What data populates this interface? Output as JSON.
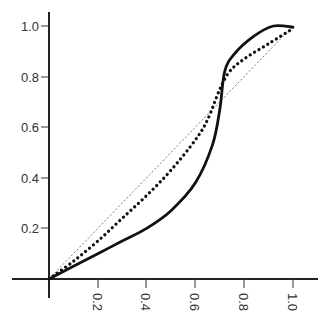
{
  "chart_data": {
    "type": "line",
    "title": "",
    "xlabel": "",
    "ylabel": "",
    "xlim": [
      0,
      1.0
    ],
    "ylim": [
      0,
      1.0
    ],
    "grid": false,
    "legend": null,
    "x_ticks": [
      "0.2",
      "0.4",
      "0.6",
      "0.8",
      "1.0"
    ],
    "y_ticks": [
      "0.2",
      "0.4",
      "0.6",
      "0.8",
      "1.0"
    ],
    "series": [
      {
        "name": "diagonal (thin dashed)",
        "style": "thin-dashed",
        "points": [
          [
            0,
            0
          ],
          [
            1.0,
            1.0
          ]
        ]
      },
      {
        "name": "dotted S-curve",
        "style": "dotted",
        "points": [
          [
            0,
            0
          ],
          [
            0.1,
            0.07
          ],
          [
            0.2,
            0.15
          ],
          [
            0.3,
            0.24
          ],
          [
            0.4,
            0.33
          ],
          [
            0.5,
            0.43
          ],
          [
            0.6,
            0.55
          ],
          [
            0.65,
            0.63
          ],
          [
            0.7,
            0.75
          ],
          [
            0.74,
            0.82
          ],
          [
            0.8,
            0.87
          ],
          [
            0.9,
            0.93
          ],
          [
            1.0,
            0.99
          ]
        ]
      },
      {
        "name": "solid S-curve",
        "style": "solid-thick",
        "points": [
          [
            0,
            0
          ],
          [
            0.1,
            0.05
          ],
          [
            0.2,
            0.1
          ],
          [
            0.3,
            0.15
          ],
          [
            0.4,
            0.2
          ],
          [
            0.5,
            0.27
          ],
          [
            0.6,
            0.38
          ],
          [
            0.67,
            0.53
          ],
          [
            0.7,
            0.67
          ],
          [
            0.72,
            0.82
          ],
          [
            0.76,
            0.89
          ],
          [
            0.84,
            0.96
          ],
          [
            0.92,
            1.0
          ],
          [
            1.0,
            0.995
          ]
        ]
      }
    ]
  }
}
